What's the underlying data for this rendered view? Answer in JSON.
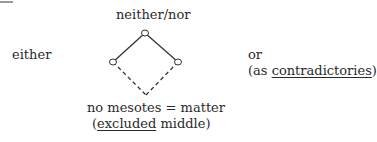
{
  "diagram": {
    "top_label": "neither/nor",
    "left_label": "either",
    "right_label": {
      "line1": "or",
      "line2_prefix": "(as ",
      "line2_underlined": "contradictories",
      "line2_suffix": ")"
    },
    "bottom_label": {
      "line1": "no mesotes = matter",
      "line2_prefix": "(",
      "line2_underlined": "excluded",
      "line2_suffix": " middle)"
    },
    "nodes": [
      {
        "id": "top",
        "x": 145,
        "y": 33,
        "circle": true
      },
      {
        "id": "left",
        "x": 113,
        "y": 62,
        "circle": true
      },
      {
        "id": "right",
        "x": 178,
        "y": 62,
        "circle": true
      },
      {
        "id": "bottom",
        "x": 146,
        "y": 95,
        "circle": false
      }
    ],
    "edges": [
      {
        "from": "top",
        "to": "left",
        "style": "solid"
      },
      {
        "from": "top",
        "to": "right",
        "style": "solid"
      },
      {
        "from": "left",
        "to": "bottom",
        "style": "dashed"
      },
      {
        "from": "right",
        "to": "bottom",
        "style": "dashed"
      }
    ],
    "line_color": "#333333"
  }
}
